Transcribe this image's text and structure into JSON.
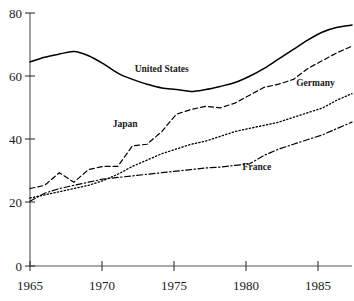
{
  "chart_data": {
    "type": "line",
    "title": "",
    "subtitle": "",
    "xlabel": "",
    "ylabel": "",
    "xlim": [
      1965,
      1987
    ],
    "ylim": [
      0,
      80
    ],
    "grid": false,
    "legend_position": "inline-labels",
    "x_ticks": [
      "1965",
      "1970",
      "1975",
      "1980",
      "1985"
    ],
    "x_tick_values": [
      1965,
      1970,
      1975,
      1980,
      1985
    ],
    "y_ticks": [
      "0",
      "20",
      "40",
      "60",
      "80"
    ],
    "y_tick_values": [
      0,
      20,
      40,
      60,
      80
    ],
    "x": [
      1965,
      1966,
      1967,
      1968,
      1969,
      1970,
      1971,
      1972,
      1973,
      1974,
      1975,
      1976,
      1977,
      1978,
      1979,
      1980,
      1981,
      1982,
      1983,
      1984,
      1985,
      1986,
      1987
    ],
    "series": [
      {
        "name": "United States",
        "style": "solid",
        "label_x": 1974.0,
        "label_y": 61.5,
        "values": [
          64.5,
          66.0,
          67.0,
          67.8,
          66.5,
          64.0,
          61.0,
          59.0,
          57.5,
          56.3,
          55.8,
          55.2,
          55.8,
          56.8,
          58.0,
          60.0,
          62.5,
          65.5,
          68.5,
          71.5,
          74.0,
          75.5,
          76.2
        ]
      },
      {
        "name": "Japan",
        "style": "dashed",
        "label_x": 1971.5,
        "label_y": 44.0,
        "values": [
          24.5,
          25.5,
          29.5,
          26.5,
          30.5,
          31.5,
          31.5,
          38.0,
          38.5,
          42.5,
          48.0,
          49.5,
          50.5,
          50.0,
          51.5,
          54.0,
          56.5,
          57.5,
          59.0,
          62.5,
          65.0,
          67.5,
          69.5
        ]
      },
      {
        "name": "Germany",
        "style": "dotted",
        "label_x": 1984.5,
        "label_y": 57.0,
        "values": [
          21.5,
          22.5,
          23.5,
          24.5,
          25.5,
          27.0,
          29.0,
          31.5,
          33.5,
          35.5,
          37.0,
          38.5,
          39.5,
          41.0,
          42.5,
          43.5,
          44.5,
          45.5,
          47.0,
          48.5,
          50.0,
          52.5,
          54.5
        ]
      },
      {
        "name": "France",
        "style": "dashdot",
        "label_x": 1980.5,
        "label_y": 30.5,
        "values": [
          20.5,
          23.0,
          24.5,
          25.5,
          26.5,
          27.5,
          28.0,
          28.5,
          29.0,
          29.5,
          30.0,
          30.5,
          31.0,
          31.3,
          31.8,
          32.3,
          35.0,
          37.0,
          38.5,
          40.0,
          41.5,
          43.5,
          45.5
        ]
      }
    ]
  },
  "axis": {
    "y_axis_name": "value-axis",
    "x_axis_name": "year-axis"
  }
}
